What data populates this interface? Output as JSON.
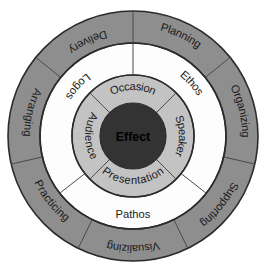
{
  "diagram": {
    "center": {
      "cx": 133,
      "cy": 136
    },
    "colors": {
      "outer_ring_fill": "#8e8e8e",
      "middle_ring_fill": "#fdfdfd",
      "inner_ring_fill": "#c3c3c3",
      "core_fill": "#333333",
      "stroke": "#2b2b2b",
      "divider": "#4a4a4a",
      "background": "#ffffff",
      "label_text": "#1a1a1a",
      "core_text": "#000000"
    },
    "radii": {
      "outer_outer": 125,
      "outer_inner": 93,
      "middle_outer": 93,
      "middle_inner": 61,
      "inner_outer": 61,
      "inner_inner": 33,
      "core": 33
    },
    "core": {
      "label": "Effect"
    },
    "inner_ring": {
      "name": "Rhetorical Situation",
      "segments": [
        {
          "label": "Occasion",
          "position": "top",
          "start_angle": -45,
          "end_angle": 45
        },
        {
          "label": "Speaker",
          "position": "right",
          "start_angle": 45,
          "end_angle": 135
        },
        {
          "label": "Presentation",
          "position": "bottom",
          "start_angle": 135,
          "end_angle": 225
        },
        {
          "label": "Audience",
          "position": "left",
          "start_angle": 225,
          "end_angle": 315
        }
      ]
    },
    "middle_ring": {
      "name": "Rhetorical Appeals",
      "segments": [
        {
          "label": "Logos",
          "position": "upper-left"
        },
        {
          "label": "Ethos",
          "position": "upper-right"
        },
        {
          "label": "Pathos",
          "position": "bottom"
        }
      ]
    },
    "outer_ring": {
      "name": "Speech Process",
      "segments": [
        {
          "label": "Planning",
          "position": "top-right",
          "start_angle": 0,
          "end_angle": 51
        },
        {
          "label": "Organizing",
          "position": "right",
          "start_angle": 51,
          "end_angle": 103
        },
        {
          "label": "Supporting",
          "position": "lower-right",
          "start_angle": 103,
          "end_angle": 154
        },
        {
          "label": "Visualizing",
          "position": "bottom",
          "start_angle": 154,
          "end_angle": 206
        },
        {
          "label": "Practicing",
          "position": "lower-left",
          "start_angle": 206,
          "end_angle": 257
        },
        {
          "label": "Arranging",
          "position": "left",
          "start_angle": 257,
          "end_angle": 309
        },
        {
          "label": "Delivery",
          "position": "top-left",
          "start_angle": 309,
          "end_angle": 360
        }
      ]
    }
  }
}
